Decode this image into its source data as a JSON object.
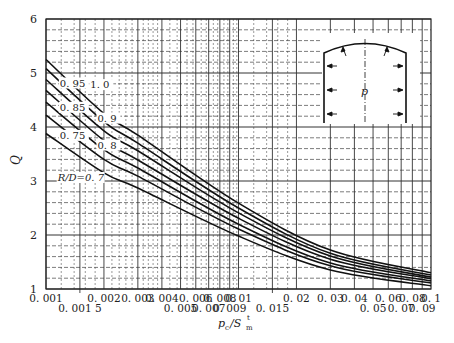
{
  "chart_data": {
    "type": "line",
    "title": "",
    "xlabel": "p_c/S_m^t",
    "xlabel_parts": {
      "p": "p",
      "c": "c",
      "sep": "/S",
      "m": "m",
      "t": "t"
    },
    "ylabel": "Q",
    "xscale": "log",
    "xlim": [
      0.001,
      0.1
    ],
    "ylim": [
      1,
      6
    ],
    "grid": true,
    "yticks": [
      1,
      2,
      3,
      4,
      5,
      6
    ],
    "xticks_row1": [
      {
        "value": 0.001,
        "label": "0. 001"
      },
      {
        "value": 0.002,
        "label": "0. 002"
      },
      {
        "value": 0.003,
        "label": "0. 003"
      },
      {
        "value": 0.004,
        "label": "0. 004"
      },
      {
        "value": 0.006,
        "label": "0. 006"
      },
      {
        "value": 0.008,
        "label": "0. 008"
      },
      {
        "value": 0.01,
        "label": "0. 01"
      },
      {
        "value": 0.02,
        "label": "0. 02"
      },
      {
        "value": 0.03,
        "label": "0. 03"
      },
      {
        "value": 0.04,
        "label": "0. 04"
      },
      {
        "value": 0.06,
        "label": "0. 06"
      },
      {
        "value": 0.08,
        "label": "0. 08"
      },
      {
        "value": 0.1,
        "label": "0. 1"
      }
    ],
    "xticks_row2": [
      {
        "value": 0.0015,
        "label": "0. 001 5"
      },
      {
        "value": 0.005,
        "label": "0. 005"
      },
      {
        "value": 0.007,
        "label": "0. 007"
      },
      {
        "value": 0.009,
        "label": "0. 009"
      },
      {
        "value": 0.015,
        "label": "0. 015"
      },
      {
        "value": 0.05,
        "label": "0. 05"
      },
      {
        "value": 0.07,
        "label": "0. 07"
      },
      {
        "value": 0.09,
        "label": "0. 09"
      }
    ],
    "x": [
      0.001,
      0.002,
      0.003,
      0.01,
      0.03,
      0.1
    ],
    "series": [
      {
        "name": "R/D=1.0",
        "label": "1. 0",
        "values": [
          5.25,
          4.25,
          3.85,
          2.59,
          1.72,
          1.3
        ]
      },
      {
        "name": "R/D=0.95",
        "label": "0. 95",
        "values": [
          5.08,
          4.1,
          3.7,
          2.5,
          1.66,
          1.26
        ]
      },
      {
        "name": "R/D=0.9",
        "label": "0. 9",
        "values": [
          4.88,
          3.93,
          3.56,
          2.41,
          1.61,
          1.22
        ]
      },
      {
        "name": "R/D=0.85",
        "label": "0. 85",
        "values": [
          4.68,
          3.75,
          3.39,
          2.31,
          1.55,
          1.19
        ]
      },
      {
        "name": "R/D=0.8",
        "label": "0. 8",
        "values": [
          4.46,
          3.58,
          3.24,
          2.2,
          1.48,
          1.15
        ]
      },
      {
        "name": "R/D=0.75",
        "label": "0. 75",
        "values": [
          4.22,
          3.4,
          3.09,
          2.11,
          1.43,
          1.11
        ]
      },
      {
        "name": "R/D=0.7",
        "label": "R/D=0. 7",
        "values": [
          3.88,
          3.15,
          2.87,
          1.98,
          1.35,
          1.06
        ]
      }
    ],
    "annotations": [
      {
        "text": "1. 0",
        "x": 0.0017,
        "y": 4.72
      },
      {
        "text": "0. 95",
        "x": 0.00118,
        "y": 4.75
      },
      {
        "text": "0. 9",
        "x": 0.00185,
        "y": 4.1
      },
      {
        "text": "0. 85",
        "x": 0.00118,
        "y": 4.3
      },
      {
        "text": "0. 8",
        "x": 0.00185,
        "y": 3.6
      },
      {
        "text": "0. 75",
        "x": 0.00118,
        "y": 3.78
      },
      {
        "text": "R/D=0. 7",
        "x": 0.00115,
        "y": 3.0
      }
    ],
    "inset": {
      "description": "tunnel cross-section with arched roof and vertical sidewalls under pressure p",
      "pressure_label": "p"
    }
  }
}
